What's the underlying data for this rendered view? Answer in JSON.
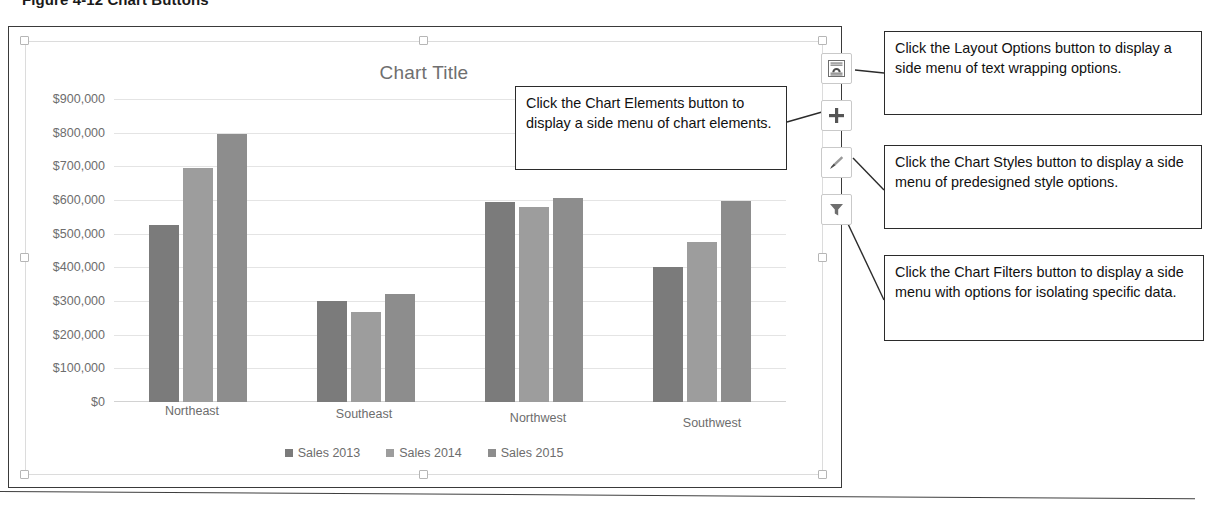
{
  "figure": {
    "caption": "Figure 4-12  Chart Buttons"
  },
  "chart_data": {
    "type": "bar",
    "title": "Chart Title",
    "xlabel": "",
    "ylabel": "",
    "categories": [
      "Northeast",
      "Southeast",
      "Northwest",
      "Southwest"
    ],
    "series": [
      {
        "name": "Sales 2013",
        "color": "#7b7b7b",
        "values": [
          525000,
          300000,
          595000,
          400000
        ]
      },
      {
        "name": "Sales 2014",
        "color": "#9d9d9d",
        "values": [
          695000,
          268000,
          580000,
          475000
        ]
      },
      {
        "name": "Sales 2015",
        "color": "#8d8d8d",
        "values": [
          795000,
          320000,
          605000,
          598000
        ]
      }
    ],
    "ylim": [
      0,
      900000
    ],
    "ytick_values": [
      900000,
      800000,
      700000,
      600000,
      500000,
      400000,
      300000,
      200000,
      100000,
      0
    ],
    "ytick_labels": [
      "$900,000",
      "$800,000",
      "$700,000",
      "$600,000",
      "$500,000",
      "$400,000",
      "$300,000",
      "$200,000",
      "$100,000",
      "$0"
    ],
    "grid": true,
    "legend_position": "bottom"
  },
  "chart_buttons": [
    {
      "id": "layout-options",
      "name": "Layout Options",
      "icon": "layout-options-icon"
    },
    {
      "id": "chart-elements",
      "name": "Chart Elements",
      "icon": "plus-icon"
    },
    {
      "id": "chart-styles",
      "name": "Chart Styles",
      "icon": "paintbrush-icon"
    },
    {
      "id": "chart-filters",
      "name": "Chart Filters",
      "icon": "funnel-icon"
    }
  ],
  "callouts": {
    "chart_elements": "Click the Chart Elements button to display a side menu of chart elements.",
    "layout_options": "Click the Layout Options button to display a side menu of text wrapping options.",
    "chart_styles": "Click the Chart Styles button to display a side menu of predesigned style options.",
    "chart_filters": "Click the Chart Filters button to display a side menu with options for isolating specific data."
  }
}
